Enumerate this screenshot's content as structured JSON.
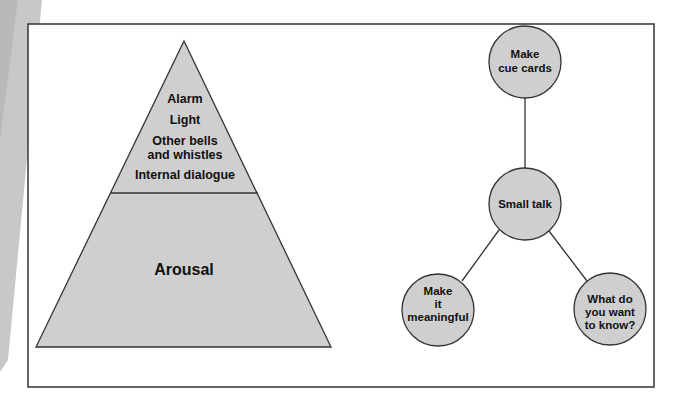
{
  "colors": {
    "fill": "#cfcfcf",
    "stroke": "#333333",
    "frame": "#333333",
    "curl": "#c8c8c8",
    "text": "#111111"
  },
  "pyramid": {
    "top_section": {
      "lines": [
        "Alarm",
        "Light",
        "Other bells",
        "and whistles",
        "Internal dialogue"
      ]
    },
    "bottom_section": {
      "label": "Arousal"
    }
  },
  "mind_map": {
    "nodes": [
      {
        "id": "top",
        "lines": [
          "Make",
          "cue cards"
        ]
      },
      {
        "id": "center",
        "lines": [
          "Small talk"
        ]
      },
      {
        "id": "bottom_left",
        "lines": [
          "Make",
          "it",
          "meaningful"
        ]
      },
      {
        "id": "bottom_right",
        "lines": [
          "What do",
          "you want",
          "to know?"
        ]
      }
    ],
    "edges": [
      [
        "center",
        "top"
      ],
      [
        "center",
        "bottom_left"
      ],
      [
        "center",
        "bottom_right"
      ]
    ]
  }
}
